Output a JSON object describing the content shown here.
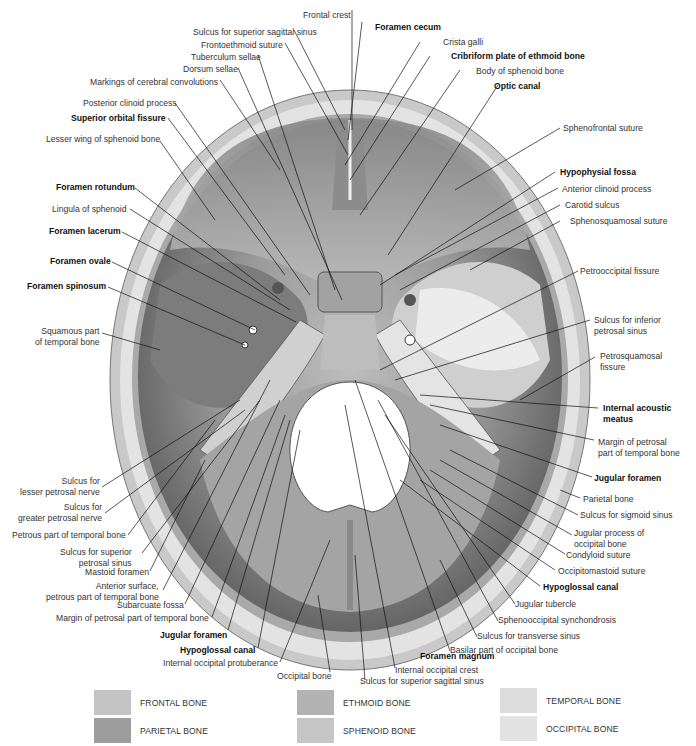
{
  "diagram": {
    "view": "superior view of skull base",
    "colors": {
      "outer_table": "#c9c9c9",
      "diploe": "#e3e3e3",
      "fossa_dark": "#5e5e5e",
      "fossa_mid": "#8f8f8f",
      "fossa_light": "#bdbdbd",
      "petrous_light": "#dadada",
      "foramen_magnum": "#ffffff",
      "leader_line": "#111111"
    },
    "labels_top": [
      {
        "id": "frontal-crest",
        "text": "Frontal crest",
        "bold": false
      },
      {
        "id": "sulcus-sup-sagittal-top",
        "text": "Sulcus for superior sagittal sinus",
        "bold": false
      },
      {
        "id": "frontoethmoid-suture",
        "text": "Frontoethmoid suture",
        "bold": false
      },
      {
        "id": "tuberculum-sellae",
        "text": "Tuberculum sellae",
        "bold": false
      },
      {
        "id": "dorsum-sellae",
        "text": "Dorsum sellae",
        "bold": false
      },
      {
        "id": "markings-cerebral",
        "text": "Markings of cerebral convolutions",
        "bold": false
      },
      {
        "id": "foramen-cecum",
        "text": "Foramen cecum",
        "bold": true
      },
      {
        "id": "crista-galli",
        "text": "Crista galli",
        "bold": false
      },
      {
        "id": "cribriform-plate",
        "text": "Cribriform plate of ethmoid bone",
        "bold": true
      },
      {
        "id": "body-sphenoid",
        "text": "Body of sphenoid bone",
        "bold": false
      },
      {
        "id": "optic-canal",
        "text": "Optic canal",
        "bold": true
      }
    ],
    "labels_left": [
      {
        "id": "posterior-clinoid",
        "text": "Posterior clinoid process",
        "bold": false
      },
      {
        "id": "superior-orbital-fissure",
        "text": "Superior orbital fissure",
        "bold": true
      },
      {
        "id": "lesser-wing",
        "text": "Lesser wing of sphenoid bone",
        "bold": false
      },
      {
        "id": "foramen-rotundum",
        "text": "Foramen rotundum",
        "bold": true
      },
      {
        "id": "lingula",
        "text": "Lingula of sphenoid",
        "bold": false
      },
      {
        "id": "foramen-lacerum",
        "text": "Foramen lacerum",
        "bold": true
      },
      {
        "id": "foramen-ovale",
        "text": "Foramen ovale",
        "bold": true
      },
      {
        "id": "foramen-spinosum",
        "text": "Foramen spinosum",
        "bold": true
      },
      {
        "id": "squamous-part",
        "text": "Squamous part\nof temporal bone",
        "bold": false
      },
      {
        "id": "sulcus-lesser-petrosal",
        "text": "Sulcus for\nlesser petrosal nerve",
        "bold": false
      },
      {
        "id": "sulcus-greater-petrosal",
        "text": "Sulcus for\ngreater petrosal nerve",
        "bold": false
      },
      {
        "id": "petrous-part",
        "text": "Petrous part of temporal bone",
        "bold": false
      },
      {
        "id": "sulcus-sup-petrosal",
        "text": "Sulcus for superior\npetrosal sinus",
        "bold": false
      },
      {
        "id": "mastoid-foramen",
        "text": "Mastoid foramen",
        "bold": false
      },
      {
        "id": "anterior-surface",
        "text": "Anterior surface,\npetrous part of temporal bone",
        "bold": false
      },
      {
        "id": "subarcuate-fossa",
        "text": "Subarcuate fossa",
        "bold": false
      },
      {
        "id": "margin-petrosal-left",
        "text": "Margin of petrosal part of temporal bone",
        "bold": false
      },
      {
        "id": "jugular-foramen-left",
        "text": "Jugular foramen",
        "bold": true
      },
      {
        "id": "hypoglossal-canal-left",
        "text": "Hypoglossal canal",
        "bold": true
      },
      {
        "id": "internal-occipital-protuberance",
        "text": "Internal occipital protuberance",
        "bold": false
      }
    ],
    "labels_right": [
      {
        "id": "sphenofrontal-suture",
        "text": "Sphenofrontal suture",
        "bold": false
      },
      {
        "id": "hypophysial-fossa",
        "text": "Hypophysial fossa",
        "bold": true
      },
      {
        "id": "anterior-clinoid",
        "text": "Anterior clinoid process",
        "bold": false
      },
      {
        "id": "carotid-sulcus",
        "text": "Carotid sulcus",
        "bold": false
      },
      {
        "id": "sphenosquamosal-suture",
        "text": "Sphenosquamosal suture",
        "bold": false
      },
      {
        "id": "petrooccipital-fissure",
        "text": "Petrooccipital fissure",
        "bold": false
      },
      {
        "id": "sulcus-inferior-petrosal",
        "text": "Sulcus for inferior\npetrosal sinus",
        "bold": false
      },
      {
        "id": "petrosquamosal-fissure",
        "text": "Petrosquamosal\nfissure",
        "bold": false
      },
      {
        "id": "internal-acoustic-meatus",
        "text": "Internal acoustic\nmeatus",
        "bold": true
      },
      {
        "id": "margin-petrosal-right",
        "text": "Margin of petrosal\npart of temporal bone",
        "bold": false
      },
      {
        "id": "jugular-foramen-right",
        "text": "Jugular foramen",
        "bold": true
      },
      {
        "id": "parietal-bone",
        "text": "Parietal bone",
        "bold": false
      },
      {
        "id": "sulcus-sigmoid",
        "text": "Sulcus for sigmoid sinus",
        "bold": false
      },
      {
        "id": "jugular-process",
        "text": "Jugular process of\noccipital bone",
        "bold": false
      },
      {
        "id": "condyloid-suture",
        "text": "Condyloid suture",
        "bold": false
      },
      {
        "id": "occipitomastoid-suture",
        "text": "Occipitomastoid suture",
        "bold": false
      },
      {
        "id": "hypoglossal-canal-right",
        "text": "Hypoglossal canal",
        "bold": true
      },
      {
        "id": "jugular-tubercle",
        "text": "Jugular tubercle",
        "bold": false
      },
      {
        "id": "sphenooccipital-synchondrosis",
        "text": "Sphenooccipital synchondrosis",
        "bold": false
      },
      {
        "id": "sulcus-transverse",
        "text": "Sulcus for transverse sinus",
        "bold": false
      },
      {
        "id": "basilar-part",
        "text": "Basilar part of occipital bone",
        "bold": false
      }
    ],
    "labels_bottom": [
      {
        "id": "foramen-magnum",
        "text": "Foramen magnum",
        "bold": true
      },
      {
        "id": "occipital-bone",
        "text": "Occipital bone",
        "bold": false
      },
      {
        "id": "internal-occipital-crest",
        "text": "Internal occipital crest",
        "bold": false
      },
      {
        "id": "sulcus-sup-sagittal-bottom",
        "text": "Sulcus for superior sagittal sinus",
        "bold": false
      }
    ]
  },
  "legend": {
    "items": [
      {
        "label": "FRONTAL BONE",
        "color": "#c4c4c4"
      },
      {
        "label": "PARIETAL BONE",
        "color": "#9d9d9d"
      },
      {
        "label": "ETHMOID BONE",
        "color": "#b3b3b3"
      },
      {
        "label": "SPHENOID BONE",
        "color": "#c6c6c6"
      },
      {
        "label": "TEMPORAL BONE",
        "color": "#dcdcdc"
      },
      {
        "label": "OCCIPITAL BONE",
        "color": "#e2e2e2"
      }
    ]
  }
}
